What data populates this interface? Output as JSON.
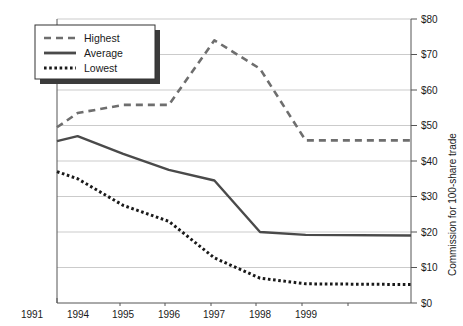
{
  "chart_data": {
    "type": "line",
    "title": "",
    "xlabel": "",
    "ylabel": "Commission for 100-share trade",
    "categories": [
      "1991",
      "1994",
      "1995",
      "1996",
      "1997",
      "1998",
      "1999"
    ],
    "ylim": [
      0,
      80
    ],
    "ytick_labels": [
      "$0",
      "$10",
      "$20",
      "$30",
      "$40",
      "$50",
      "$60",
      "$70",
      "$80"
    ],
    "ytick_values": [
      0,
      10,
      20,
      30,
      40,
      50,
      60,
      70,
      80
    ],
    "grid": true,
    "legend_position": "top-left",
    "series": [
      {
        "name": "Highest",
        "style": "dashed",
        "color": "#6e6e6e",
        "values": [
          49.5,
          53.5,
          55.8,
          55.8,
          74.0,
          66.0,
          45.8
        ],
        "extended_end_value": 45.8
      },
      {
        "name": "Average",
        "style": "solid",
        "color": "#4a4a4a",
        "values": [
          45.6,
          47.0,
          42.0,
          37.5,
          34.5,
          20.0,
          19.2
        ],
        "extended_end_value": 19.0
      },
      {
        "name": "Lowest",
        "style": "dotted",
        "color": "#1a1a1a",
        "values": [
          37.0,
          35.0,
          27.5,
          23.0,
          12.7,
          7.0,
          5.4
        ],
        "extended_end_value": 5.2
      }
    ]
  },
  "legend": {
    "items": [
      {
        "label": "Highest",
        "style": "dashed"
      },
      {
        "label": "Average",
        "style": "solid"
      },
      {
        "label": "Lowest",
        "style": "dotted"
      }
    ]
  },
  "axes": {
    "y_axis_title": "Commission for 100-share trade"
  }
}
